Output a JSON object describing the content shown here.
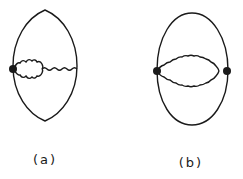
{
  "figure": {
    "panels": [
      {
        "id": "a",
        "label": "(a)",
        "description": "Closed loop with a single vertex on the left; wavy self-energy bubble attached to vertex, continuing as a wavy line to the right side of the loop"
      },
      {
        "id": "b",
        "label": "(b)",
        "description": "Closed loop with two vertices on left and right; two wavy lines forming a bubble between the vertices"
      }
    ]
  },
  "colors": {
    "stroke": "#1a1a1a",
    "background": "#ffffff"
  }
}
